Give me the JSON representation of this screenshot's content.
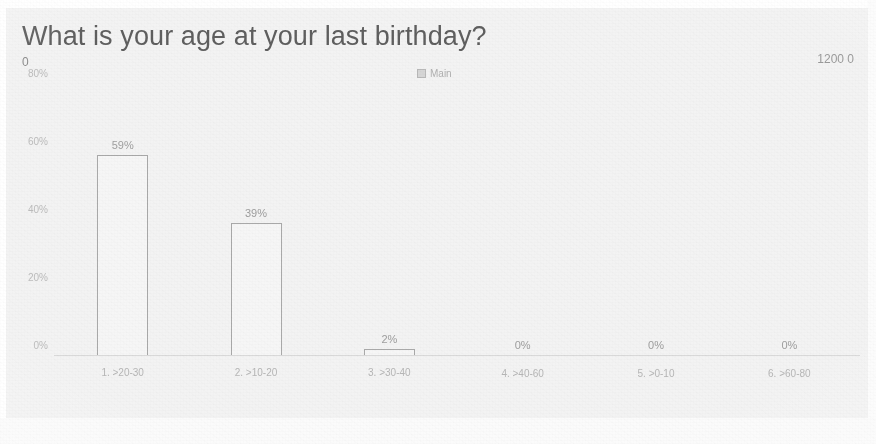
{
  "header": {
    "title": "What is your age at your last birthday?",
    "corner_left": "0",
    "corner_right": "1200 0"
  },
  "legend": {
    "swatch_icon": "series-swatch-icon",
    "label": "Main",
    "position": "top-center"
  },
  "chart_data": {
    "type": "bar",
    "title": "What is your age at your last birthday?",
    "xlabel": "",
    "ylabel": "",
    "ylim": [
      0,
      80
    ],
    "grid": false,
    "legend": [
      "Main"
    ],
    "ytick_labels": [
      "80%",
      "60%",
      "40%",
      "20%",
      "0%"
    ],
    "ytick_values": [
      80,
      60,
      40,
      20,
      0
    ],
    "categories": [
      "1. >20-30",
      "2. >10-20",
      "3. >30-40",
      "4. >40-60",
      "5. >0-10",
      "6. >60-80"
    ],
    "values": [
      59,
      39,
      2,
      0,
      0,
      0
    ],
    "value_labels": [
      "59%",
      "39%",
      "2%",
      "0%",
      "0%",
      "0%"
    ],
    "series": [
      {
        "name": "Main",
        "values": [
          59,
          39,
          2,
          0,
          0,
          0
        ]
      }
    ],
    "colors": {
      "bar_outline": "#a9a9a9",
      "text": "#9e9e9e",
      "axis": "#d9d9d9",
      "title": "#5f5f5f",
      "background": "#f3f3f3"
    }
  }
}
